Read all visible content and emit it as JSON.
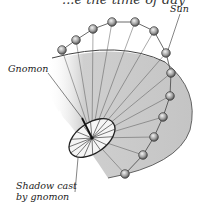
{
  "header": {
    "partial_text": "...e the time of day"
  },
  "labels": {
    "sun": "Sun",
    "gnomon": "Gnomon",
    "shadow_line1": "Shadow cast",
    "shadow_line2": "by gnomon"
  },
  "diagram": {
    "type": "sundial sun path illustration",
    "sun_positions": [
      [
        62,
        50
      ],
      [
        76,
        40
      ],
      [
        93,
        29
      ],
      [
        112,
        22
      ],
      [
        135,
        22
      ],
      [
        154,
        31
      ],
      [
        166,
        53
      ],
      [
        171,
        73
      ],
      [
        170,
        96
      ],
      [
        163,
        117
      ],
      [
        154,
        137
      ],
      [
        143,
        155
      ],
      [
        125,
        174
      ]
    ],
    "dial_center": [
      92,
      138
    ],
    "colors": {
      "shadow_fill": "#c8c8c8",
      "dial_fill": "#f4f4f4",
      "sun_fill": "#a0a0a0",
      "line": "#333333"
    }
  }
}
